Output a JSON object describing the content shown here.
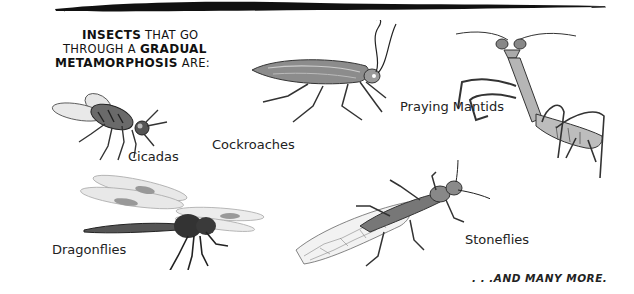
{
  "intro": {
    "line1_bold": "Insects",
    "line1_rest": " that go",
    "line2_rest": "through a ",
    "line2_bold": "gradual",
    "line3_bold": "metamorphosis",
    "line3_rest": " are:"
  },
  "insects": [
    {
      "name": "cicada",
      "label": "Cicadas"
    },
    {
      "name": "cockroach",
      "label": "Cockroaches"
    },
    {
      "name": "praying-mantis",
      "label": "Praying Mantids"
    },
    {
      "name": "dragonfly",
      "label": "Dragonflies"
    },
    {
      "name": "stonefly",
      "label": "Stoneflies"
    }
  ],
  "outro": ". . .and many more.",
  "colors": {
    "ink": "#111111",
    "body_gray": "#777777",
    "wing_gray": "#cfcfcf",
    "background": "#ffffff"
  }
}
